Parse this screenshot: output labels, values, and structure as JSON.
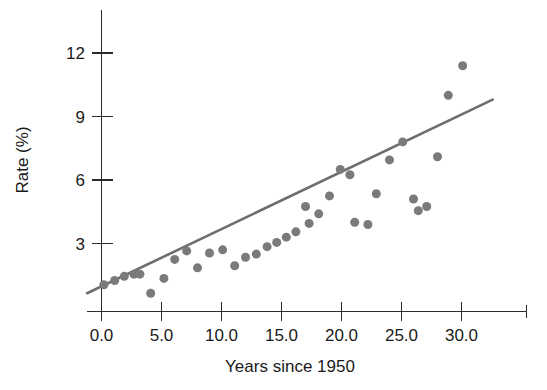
{
  "chart_data": {
    "type": "scatter",
    "title": "",
    "subtitle": "",
    "xlabel": "Years since 1950",
    "ylabel": "Rate (%)",
    "xlim": [
      -1.2,
      33.0
    ],
    "ylim": [
      0.0,
      13.4
    ],
    "grid": false,
    "legend": null,
    "x_ticks": [
      0.0,
      5.0,
      10.0,
      15.0,
      20.0,
      25.0,
      30.0
    ],
    "x_tick_labels": [
      "0.0",
      "5.0",
      "10.0",
      "15.0",
      "20.0",
      "25.0",
      "30.0"
    ],
    "y_ticks": [
      3,
      6,
      9,
      12
    ],
    "y_tick_labels": [
      "3",
      "6",
      "9",
      "12"
    ],
    "point_color": "#7a7a7a",
    "line_color": "#6e6e6e",
    "axis_color": "#2b2b2b",
    "marker_size": 9,
    "series": [
      {
        "name": "Rate",
        "x": [
          0.2,
          1.1,
          1.9,
          2.7,
          3.2,
          4.1,
          5.2,
          6.1,
          7.1,
          8.0,
          9.0,
          10.1,
          11.1,
          12.0,
          12.9,
          13.8,
          14.6,
          15.4,
          16.2,
          17.0,
          17.3,
          18.1,
          19.0,
          19.9,
          20.7,
          21.1,
          22.2,
          22.9,
          24.0,
          25.1,
          26.0,
          26.4,
          27.1,
          28.0,
          28.9,
          30.1
        ],
        "y": [
          1.05,
          1.25,
          1.45,
          1.55,
          1.55,
          0.65,
          1.35,
          2.25,
          2.65,
          1.85,
          2.55,
          2.7,
          1.95,
          2.35,
          2.5,
          2.85,
          3.05,
          3.3,
          3.55,
          4.75,
          3.95,
          4.4,
          5.25,
          6.5,
          6.25,
          4.0,
          3.9,
          5.35,
          6.95,
          7.8,
          5.1,
          4.55,
          4.75,
          7.1,
          10.0,
          11.4
        ]
      }
    ],
    "trend_line": {
      "name": "least-squares fit",
      "x_start": -1.2,
      "y_start": 0.65,
      "x_end": 32.6,
      "y_end": 9.8
    }
  }
}
